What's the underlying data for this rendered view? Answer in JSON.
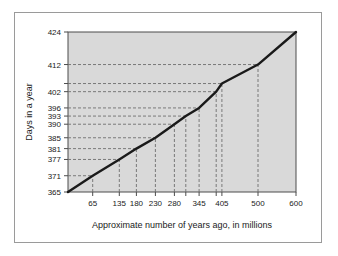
{
  "chart_data": {
    "type": "line",
    "title": "",
    "xlabel": "Approximate number of years ago, in millions",
    "ylabel": "Days in a year",
    "xlim": [
      600,
      0
    ],
    "ylim": [
      365,
      424
    ],
    "grid": true,
    "legend": "none",
    "x_tick_labels": [
      "65",
      "135",
      "180",
      "230",
      "280",
      "345",
      "405",
      "500",
      "600"
    ],
    "x_tick_values": [
      65,
      135,
      180,
      230,
      280,
      345,
      405,
      500,
      600
    ],
    "x_unlabeled_ticks": [
      310,
      390
    ],
    "y_tick_labels": [
      "365",
      "371",
      "377",
      "381",
      "385",
      "390",
      "393",
      "396",
      "402",
      "412",
      "424"
    ],
    "y_tick_values": [
      365,
      371,
      377,
      381,
      385,
      390,
      393,
      396,
      402,
      412,
      424
    ],
    "y_unlabeled_ticks": [
      405
    ],
    "series": [
      {
        "name": "Days in a year",
        "x": [
          0,
          65,
          135,
          180,
          230,
          280,
          310,
          345,
          390,
          405,
          500,
          600
        ],
        "values": [
          365,
          371,
          377,
          381,
          385,
          390,
          393,
          396,
          402,
          405,
          412,
          424
        ]
      }
    ],
    "leader_lines": [
      {
        "x": 65,
        "y": 371
      },
      {
        "x": 135,
        "y": 377
      },
      {
        "x": 180,
        "y": 381
      },
      {
        "x": 230,
        "y": 385
      },
      {
        "x": 280,
        "y": 390
      },
      {
        "x": 310,
        "y": 393
      },
      {
        "x": 345,
        "y": 396
      },
      {
        "x": 390,
        "y": 402
      },
      {
        "x": 405,
        "y": 405
      },
      {
        "x": 500,
        "y": 412
      }
    ],
    "colors": {
      "plot_background": "#d9d9d9",
      "line": "#1a1a1a",
      "grid": "#6e6e6e",
      "axis": "#4d4d4d",
      "frame": "#9a9a9a",
      "text": "#1a1a1a",
      "page_background": "#ffffff"
    }
  }
}
